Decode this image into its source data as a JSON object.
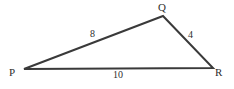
{
  "figure": {
    "type": "geometry-diagram",
    "shape": "triangle",
    "name": "Triangle PQR",
    "background_color": "#ffffff",
    "stroke_color": "#3a3a3a",
    "text_color": "#2e2e2e",
    "stroke_width": 2
  },
  "vertices": [
    {
      "id": "P",
      "label": "P",
      "x": 24,
      "y": 69,
      "label_x": 9,
      "label_y": 67
    },
    {
      "id": "Q",
      "label": "Q",
      "x": 163,
      "y": 16,
      "label_x": 158,
      "label_y": 2
    },
    {
      "id": "R",
      "label": "R",
      "x": 213,
      "y": 68,
      "label_x": 215,
      "label_y": 67
    }
  ],
  "sides": [
    {
      "id": "PQ",
      "from": "P",
      "to": "Q",
      "length_label": "8",
      "label_x": 90,
      "label_y": 29
    },
    {
      "id": "QR",
      "from": "Q",
      "to": "R",
      "length_label": "4",
      "label_x": 188,
      "label_y": 30
    },
    {
      "id": "PR",
      "from": "P",
      "to": "R",
      "length_label": "10",
      "label_x": 113,
      "label_y": 70
    }
  ],
  "chart_data": {
    "type": "diagram",
    "points": {
      "P": [
        24,
        69
      ],
      "Q": [
        163,
        16
      ],
      "R": [
        213,
        68
      ]
    },
    "edges": [
      {
        "from": "P",
        "to": "Q",
        "value": 8
      },
      {
        "from": "Q",
        "to": "R",
        "value": 4
      },
      {
        "from": "P",
        "to": "R",
        "value": 10
      }
    ],
    "vertex_labels": [
      "P",
      "Q",
      "R"
    ],
    "edge_labels": [
      "8",
      "4",
      "10"
    ],
    "xlabel": "",
    "ylabel": "",
    "grid": false,
    "legend": false
  }
}
